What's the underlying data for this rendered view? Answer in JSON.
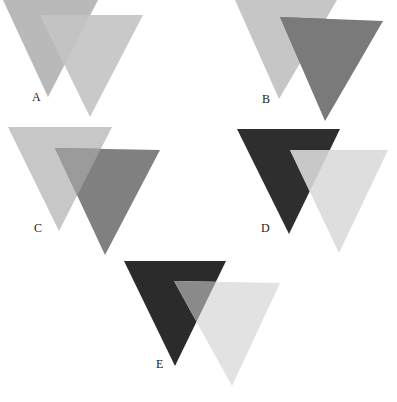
{
  "figure": {
    "panels": [
      {
        "id": "A",
        "label": "A",
        "label_pos": [
          32,
          101
        ],
        "back": {
          "points": "3,0 98,0 48,97",
          "fill": "#b9b9b9"
        },
        "front": {
          "points": "40,15 143,15 90,117",
          "fill": "#c9c9c9"
        },
        "overlap_fill": "#c3c3c3"
      },
      {
        "id": "B",
        "label": "B",
        "label_pos": [
          262,
          103
        ],
        "back": {
          "points": "235,0 337,0 279,99",
          "fill": "#c6c6c6"
        },
        "front": {
          "points": "280,17 383,21 325,121",
          "fill": "#7a7a7a"
        },
        "overlap_fill": "#7a7a7a"
      },
      {
        "id": "C",
        "label": "C",
        "label_pos": [
          34,
          232
        ],
        "back": {
          "points": "8,127 112,127 59,231",
          "fill": "#c7c7c7"
        },
        "front": {
          "points": "55,148 160,150 105,255",
          "fill": "#808080"
        },
        "overlap_fill": "#9b9b9b"
      },
      {
        "id": "D",
        "label": "D",
        "label_pos": [
          261,
          232
        ],
        "back": {
          "points": "237,129 340,129 289,234",
          "fill": "#2e2e2e"
        },
        "front": {
          "points": "290,150 388,150 339,253",
          "fill": "#dedede"
        },
        "overlap_fill": "#c8c8c8"
      },
      {
        "id": "E",
        "label": "E",
        "label_pos": [
          156,
          368
        ],
        "back": {
          "points": "124,261 226,261 175,366",
          "fill": "#2b2b2b"
        },
        "front": {
          "points": "174,281 280,283 232,386",
          "fill": "#e2e2e2"
        },
        "overlap_fill": "#8a8a8a"
      }
    ]
  }
}
